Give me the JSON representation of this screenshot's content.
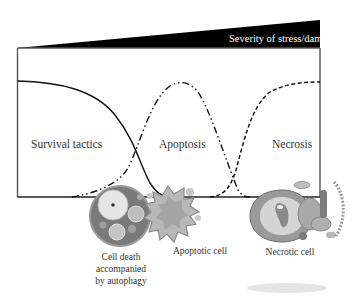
{
  "diagram": {
    "banner": {
      "label": "Severity of stress/damage"
    },
    "regions": [
      {
        "id": "survival",
        "label": "Survival tactics"
      },
      {
        "id": "apoptosis",
        "label": "Apoptosis"
      },
      {
        "id": "necrosis",
        "label": "Necrosis"
      }
    ],
    "cells": [
      {
        "id": "autophagy",
        "caption_lines": [
          "Cell death",
          "accompanied",
          "by autophagy"
        ]
      },
      {
        "id": "apoptotic",
        "caption_lines": [
          "Apoptotic cell"
        ]
      },
      {
        "id": "necrotic",
        "caption_lines": [
          "Necrotic cell"
        ]
      }
    ],
    "curves": [
      {
        "id": "survival",
        "style": "solid",
        "description": "high at low stress, decreasing to zero"
      },
      {
        "id": "autophagy-apoptosis",
        "style": "dash-dot-dot",
        "description": "bell curve peaking at intermediate stress"
      },
      {
        "id": "necrosis",
        "style": "dashed",
        "description": "rising sigmoid to plateau at high stress"
      }
    ],
    "colors": {
      "ink": "#1a1a1a",
      "banner": "#000000",
      "cell_gray": "#8a8a8a",
      "cell_light": "#d0d0d0"
    }
  }
}
